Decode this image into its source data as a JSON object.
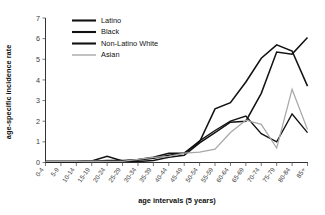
{
  "chart_data": {
    "type": "line",
    "title": "",
    "subtitle": "",
    "xlabel": "age intervals (5 years)",
    "ylabel": "age-specific incidence rate",
    "categories": [
      "0-4",
      "5-9",
      "10-14",
      "15-19",
      "20-24",
      "25-29",
      "30-34",
      "35-39",
      "40-44",
      "45-49",
      "50-54",
      "55-59",
      "60-64",
      "65-69",
      "70-74",
      "75-79",
      "80-84",
      "85+"
    ],
    "xlim": [
      0,
      17
    ],
    "ylim": [
      0,
      7
    ],
    "yticks": [
      0,
      1,
      2,
      3,
      4,
      5,
      6,
      7
    ],
    "grid": false,
    "legend_position": "top-center",
    "series": [
      {
        "name": "Latino",
        "color": "#121212",
        "values": [
          0.05,
          0.05,
          0.05,
          0.07,
          0.1,
          0.1,
          0.12,
          0.2,
          0.35,
          0.45,
          1.05,
          1.55,
          2.0,
          2.25,
          1.4,
          1.0,
          2.35,
          1.45
        ]
      },
      {
        "name": "Black",
        "color": "#121212",
        "values": [
          0.05,
          0.05,
          0.05,
          0.07,
          0.05,
          0.05,
          0.05,
          0.1,
          0.25,
          0.35,
          0.95,
          1.45,
          1.95,
          2.0,
          3.35,
          5.35,
          5.25,
          6.05
        ]
      },
      {
        "name": "Non-Latino White",
        "color": "#121212",
        "values": [
          0.05,
          0.05,
          0.05,
          0.07,
          0.3,
          0.07,
          0.15,
          0.25,
          0.45,
          0.45,
          1.0,
          2.6,
          2.9,
          3.9,
          5.05,
          5.7,
          5.4,
          3.7
        ]
      },
      {
        "name": "Asian",
        "color": "#a8a8a8",
        "values": [
          0.05,
          0.05,
          0.05,
          0.07,
          0.05,
          0.05,
          0.15,
          0.25,
          0.3,
          0.45,
          0.5,
          0.65,
          1.45,
          2.05,
          1.85,
          0.7,
          3.55,
          1.6
        ]
      }
    ]
  },
  "legend": {
    "items": [
      {
        "label": "Latino",
        "swatch_color": "#121212",
        "swatch_width": 2.1
      },
      {
        "label": "Black",
        "swatch_color": "#121212",
        "swatch_width": 2.1
      },
      {
        "label": "Non-Latino White",
        "swatch_color": "#121212",
        "swatch_width": 2.1
      },
      {
        "label": "Asian",
        "swatch_color": "#a8a8a8",
        "swatch_width": 1.4
      }
    ]
  },
  "axes": {
    "y_title": "age-specific incidence rate",
    "x_title": "age intervals (5 years)",
    "y_tick_labels": [
      "0",
      "1",
      "2",
      "3",
      "4",
      "5",
      "6",
      "7"
    ],
    "x_tick_labels": [
      "0-4",
      "5-9",
      "10-14",
      "15-19",
      "20-24",
      "25-29",
      "30-34",
      "35-39",
      "40-44",
      "45-49",
      "50-54",
      "55-59",
      "60-64",
      "65-69",
      "70-74",
      "75-79",
      "80-84",
      "85+"
    ]
  }
}
